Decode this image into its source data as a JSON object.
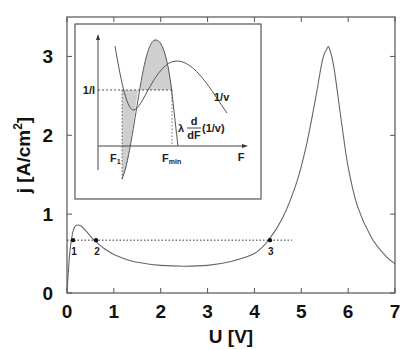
{
  "chart_data": {
    "type": "line",
    "title": "",
    "xlabel": "U [V]",
    "ylabel": "j [A/cm2]",
    "ylabel_base": "j [A/cm",
    "ylabel_sup": "2",
    "ylabel_close": "]",
    "xlim": [
      0,
      7
    ],
    "ylim": [
      0,
      3.5
    ],
    "x_ticks": [
      "0",
      "1",
      "2",
      "3",
      "4",
      "5",
      "6",
      "7"
    ],
    "y_ticks": [
      "0",
      "1",
      "2",
      "3"
    ],
    "grid": false,
    "series": [
      {
        "name": "j(U)",
        "x": [
          0,
          0.05,
          0.1,
          0.15,
          0.2,
          0.3,
          0.4,
          0.5,
          0.6,
          0.8,
          1.0,
          1.3,
          1.6,
          2.0,
          2.5,
          3.0,
          3.5,
          4.0,
          4.3,
          4.6,
          4.9,
          5.1,
          5.3,
          5.45,
          5.55,
          5.6,
          5.7,
          5.85,
          6.0,
          6.2,
          6.5,
          6.8,
          7.0
        ],
        "values": [
          0,
          0.45,
          0.7,
          0.82,
          0.86,
          0.85,
          0.79,
          0.72,
          0.66,
          0.56,
          0.49,
          0.42,
          0.38,
          0.35,
          0.34,
          0.35,
          0.4,
          0.5,
          0.67,
          0.95,
          1.4,
          1.85,
          2.45,
          2.95,
          3.1,
          3.1,
          2.85,
          2.2,
          1.6,
          1.1,
          0.7,
          0.47,
          0.37
        ]
      }
    ],
    "reference_line": {
      "style": "dotted",
      "j": 0.67,
      "x_from": 0,
      "x_to": 4.8
    },
    "points": [
      {
        "label": "1",
        "U": 0.13,
        "j": 0.67
      },
      {
        "label": "2",
        "U": 0.62,
        "j": 0.67
      },
      {
        "label": "3",
        "U": 4.33,
        "j": 0.67
      }
    ],
    "inset": {
      "type": "line",
      "xlabel": "F",
      "curves": [
        {
          "name": "1/v",
          "label": "1/v",
          "shape": "wave: starts high, dips to minimum, rises to broad maximum, then decreases"
        },
        {
          "name": "λ d/dF (1/v)",
          "label_prefix": "λ",
          "label_num": "d",
          "label_den": "dF",
          "label_suffix": "(1/v)",
          "shape": "derivative: from negative minimum, rises to sharp peak, falls through zero"
        }
      ],
      "horizontal_level": {
        "label": "1/l",
        "style": "dashed"
      },
      "markers": [
        {
          "label": "F",
          "sub": "1"
        },
        {
          "label": "F",
          "sub": "min"
        }
      ],
      "shaded_regions": "grey areas between derivative curve and 1/l level from F1 to Fmin"
    }
  }
}
